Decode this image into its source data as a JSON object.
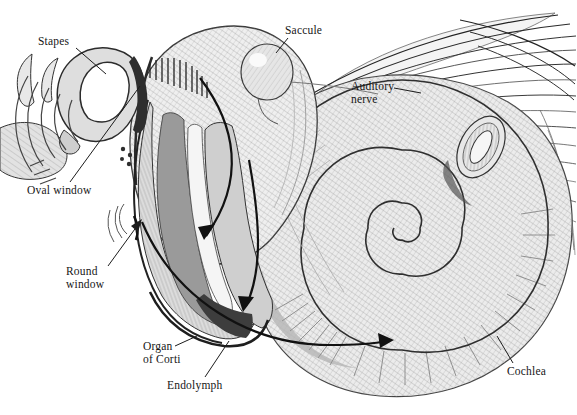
{
  "figure": {
    "background_color": "#ffffff",
    "ink_color": "#1c1c1c",
    "labels": {
      "stapes": "Stapes",
      "saccule": "Saccule",
      "auditory_nerve": "Auditory\nnerve",
      "oval_window": "Oval window",
      "round_window": "Round\nwindow",
      "organ_of_corti": "Organ\nof Corti",
      "endolymph": "Endolymph",
      "cochlea": "Cochlea"
    }
  }
}
